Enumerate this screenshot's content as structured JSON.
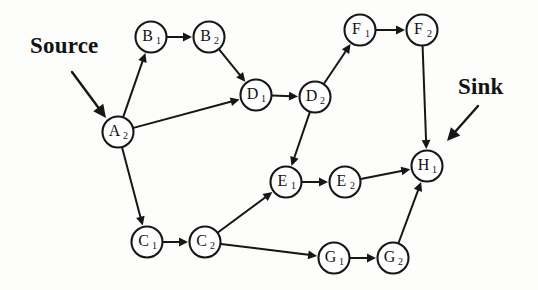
{
  "diagram": {
    "background_color": "#fdfdfb",
    "stroke_color": "#161616",
    "node_fill": "#ffffff",
    "node_radius": 15.5,
    "annotations": [
      {
        "id": "source",
        "label": "Source",
        "text_x": 30,
        "text_y": 33,
        "arrow": {
          "x1": 72,
          "y1": 72,
          "x2": 106,
          "y2": 118
        }
      },
      {
        "id": "sink",
        "label": "Sink",
        "text_x": 458,
        "text_y": 74,
        "arrow": {
          "x1": 478,
          "y1": 106,
          "x2": 447,
          "y2": 141
        }
      }
    ],
    "nodes": [
      {
        "id": "A2",
        "letter": "A",
        "subscript": "2",
        "x": 118,
        "y": 132
      },
      {
        "id": "B1",
        "letter": "B",
        "subscript": "1",
        "x": 151,
        "y": 37
      },
      {
        "id": "B2",
        "letter": "B",
        "subscript": "2",
        "x": 209,
        "y": 37
      },
      {
        "id": "C1",
        "letter": "C",
        "subscript": "1",
        "x": 147,
        "y": 242
      },
      {
        "id": "C2",
        "letter": "C",
        "subscript": "2",
        "x": 205,
        "y": 242
      },
      {
        "id": "D1",
        "letter": "D",
        "subscript": "1",
        "x": 256,
        "y": 95
      },
      {
        "id": "D2",
        "letter": "D",
        "subscript": "2",
        "x": 315,
        "y": 97
      },
      {
        "id": "E1",
        "letter": "E",
        "subscript": "1",
        "x": 286,
        "y": 182
      },
      {
        "id": "E2",
        "letter": "E",
        "subscript": "2",
        "x": 345,
        "y": 182
      },
      {
        "id": "F1",
        "letter": "F",
        "subscript": "1",
        "x": 360,
        "y": 30
      },
      {
        "id": "F2",
        "letter": "F",
        "subscript": "2",
        "x": 422,
        "y": 30
      },
      {
        "id": "G1",
        "letter": "G",
        "subscript": "1",
        "x": 334,
        "y": 258
      },
      {
        "id": "G2",
        "letter": "G",
        "subscript": "2",
        "x": 393,
        "y": 258
      },
      {
        "id": "H1",
        "letter": "H",
        "subscript": "1",
        "x": 427,
        "y": 166
      }
    ],
    "edges": [
      {
        "from": "A2",
        "to": "B1"
      },
      {
        "from": "A2",
        "to": "D1"
      },
      {
        "from": "A2",
        "to": "C1"
      },
      {
        "from": "B1",
        "to": "B2"
      },
      {
        "from": "B2",
        "to": "D1"
      },
      {
        "from": "D1",
        "to": "D2"
      },
      {
        "from": "D2",
        "to": "F1"
      },
      {
        "from": "D2",
        "to": "E1"
      },
      {
        "from": "F1",
        "to": "F2"
      },
      {
        "from": "F2",
        "to": "H1"
      },
      {
        "from": "C1",
        "to": "C2"
      },
      {
        "from": "C2",
        "to": "E1"
      },
      {
        "from": "C2",
        "to": "G1"
      },
      {
        "from": "E1",
        "to": "E2"
      },
      {
        "from": "E2",
        "to": "H1"
      },
      {
        "from": "G1",
        "to": "G2"
      },
      {
        "from": "G2",
        "to": "H1"
      }
    ]
  }
}
